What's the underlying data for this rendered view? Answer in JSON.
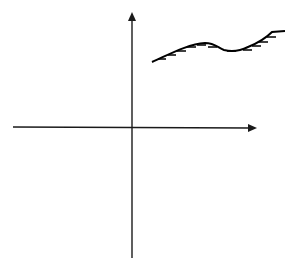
{
  "diagram": {
    "type": "cartesian-axes-with-hatched-curve",
    "colors": {
      "background": "#ffffff",
      "axis": "#1a1a1a",
      "curve": "#000000"
    },
    "axes": {
      "x_axis": {
        "label": "",
        "direction": "right",
        "arrow": true
      },
      "y_axis": {
        "label": "",
        "direction": "up",
        "arrow": true
      }
    },
    "curve": {
      "description": "wavy boundary curve in first quadrant with short hatch marks on its underside",
      "hatch_count": 11
    }
  }
}
